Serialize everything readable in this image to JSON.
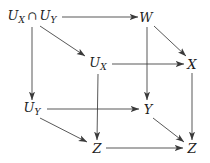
{
  "figure": {
    "kind": "commutative-diagram",
    "shape": "cube",
    "title": "",
    "background_color": "#ffffff",
    "line_color": "#3a3a3a",
    "text_color": "#1c1c1c"
  },
  "nodes": [
    {
      "id": "UXcapUY",
      "base": "U",
      "sub": "X",
      "op": "∩",
      "base2": "U",
      "sub2": "Y",
      "plain": "U_X ∩ U_Y",
      "x": 32,
      "y": 17
    },
    {
      "id": "W",
      "base": "W",
      "sub": "",
      "plain": "W",
      "x": 146,
      "y": 17
    },
    {
      "id": "UX",
      "base": "U",
      "sub": "X",
      "plain": "U_X",
      "x": 98,
      "y": 64
    },
    {
      "id": "X",
      "base": "X",
      "sub": "",
      "plain": "X",
      "x": 192,
      "y": 64
    },
    {
      "id": "UY",
      "base": "U",
      "sub": "Y",
      "plain": "U_Y",
      "x": 32,
      "y": 109
    },
    {
      "id": "Y",
      "base": "Y",
      "sub": "",
      "plain": "Y",
      "x": 148,
      "y": 109
    },
    {
      "id": "Z1",
      "base": "Z",
      "sub": "",
      "plain": "Z",
      "x": 97,
      "y": 148
    },
    {
      "id": "Z2",
      "base": "Z",
      "sub": "",
      "plain": "Z",
      "x": 192,
      "y": 148
    }
  ],
  "edges": [
    {
      "id": "UXcapUY-to-W",
      "from": "UXcapUY",
      "to": "W",
      "style": "horizontal",
      "label": ""
    },
    {
      "id": "UXcapUY-to-UX",
      "from": "UXcapUY",
      "to": "UX",
      "style": "diagonal",
      "label": ""
    },
    {
      "id": "UXcapUY-to-UY",
      "from": "UXcapUY",
      "to": "UY",
      "style": "vertical",
      "label": ""
    },
    {
      "id": "W-to-X",
      "from": "W",
      "to": "X",
      "style": "diagonal",
      "label": ""
    },
    {
      "id": "W-to-Y",
      "from": "W",
      "to": "Y",
      "style": "vertical",
      "label": ""
    },
    {
      "id": "UX-to-X",
      "from": "UX",
      "to": "X",
      "style": "horizontal",
      "label": ""
    },
    {
      "id": "UX-to-Z1",
      "from": "UX",
      "to": "Z1",
      "style": "vertical",
      "label": ""
    },
    {
      "id": "X-to-Z2",
      "from": "X",
      "to": "Z2",
      "style": "vertical",
      "label": ""
    },
    {
      "id": "UY-to-Y",
      "from": "UY",
      "to": "Y",
      "style": "horizontal",
      "label": ""
    },
    {
      "id": "UY-to-Z1",
      "from": "UY",
      "to": "Z1",
      "style": "diagonal",
      "label": ""
    },
    {
      "id": "Y-to-Z2",
      "from": "Y",
      "to": "Z2",
      "style": "diagonal",
      "label": ""
    },
    {
      "id": "Z1-to-Z2",
      "from": "Z1",
      "to": "Z2",
      "style": "horizontal",
      "label": ""
    }
  ]
}
